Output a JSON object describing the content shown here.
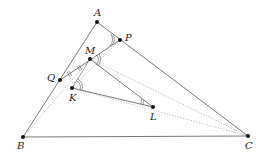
{
  "diagram": {
    "points": {
      "A": {
        "label": "A",
        "x": 97,
        "y": 22
      },
      "P": {
        "label": "P",
        "x": 120,
        "y": 40
      },
      "M": {
        "label": "M",
        "x": 90,
        "y": 59
      },
      "Q": {
        "label": "Q",
        "x": 60,
        "y": 80
      },
      "K": {
        "label": "K",
        "x": 72,
        "y": 88
      },
      "L": {
        "label": "L",
        "x": 153,
        "y": 107
      },
      "B": {
        "label": "B",
        "x": 23,
        "y": 137
      },
      "C": {
        "label": "C",
        "x": 248,
        "y": 136
      }
    },
    "solid_segments": [
      [
        "A",
        "B"
      ],
      [
        "A",
        "C"
      ],
      [
        "B",
        "C"
      ],
      [
        "Q",
        "P"
      ],
      [
        "M",
        "L"
      ],
      [
        "K",
        "L"
      ],
      [
        "M",
        "K"
      ]
    ],
    "dotted_segments": [
      [
        "B",
        "M"
      ],
      [
        "B",
        "K"
      ],
      [
        "P",
        "K"
      ],
      [
        "L",
        "C"
      ],
      [
        "M",
        "C"
      ]
    ],
    "colors": {
      "line": "#555555",
      "dotted": "#999999",
      "point": "#111111"
    }
  }
}
